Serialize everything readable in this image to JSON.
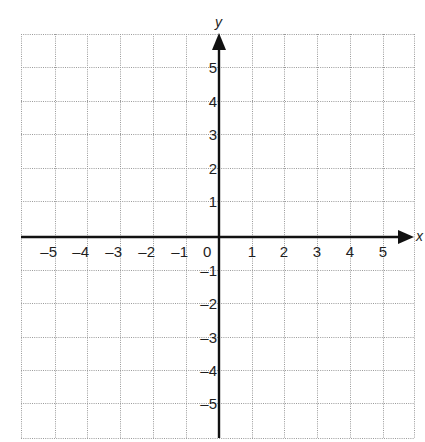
{
  "top_fragment": {
    "text": "(y = ...)"
  },
  "plane": {
    "grid": {
      "left": 21,
      "top": 34,
      "right": 414,
      "bottom": 438,
      "line_color": "#9a9a9a",
      "axis_color": "#111111"
    },
    "x_axis": {
      "name": "x",
      "y_px": 237,
      "min": -5,
      "max": 5,
      "arrow": "right"
    },
    "y_axis": {
      "name": "y",
      "x_px": 219,
      "min": -5,
      "max": 5,
      "arrow": "up"
    },
    "x_gridlines": [
      21,
      55,
      87,
      120,
      153,
      186,
      219,
      252,
      284,
      317,
      350,
      383,
      414
    ],
    "y_gridlines": [
      34,
      67,
      101,
      134,
      168,
      201,
      237,
      270,
      303,
      337,
      370,
      403,
      438
    ],
    "x_tick_labels": [
      {
        "value": "–5",
        "x": 55
      },
      {
        "value": "–4",
        "x": 87
      },
      {
        "value": "–3",
        "x": 120
      },
      {
        "value": "–2",
        "x": 153
      },
      {
        "value": "–1",
        "x": 186
      },
      {
        "value": "0",
        "x": 215
      },
      {
        "value": "1",
        "x": 252
      },
      {
        "value": "2",
        "x": 284
      },
      {
        "value": "3",
        "x": 317
      },
      {
        "value": "4",
        "x": 350
      },
      {
        "value": "5",
        "x": 383
      }
    ],
    "y_tick_labels": [
      {
        "value": "5",
        "y": 67
      },
      {
        "value": "4",
        "y": 101
      },
      {
        "value": "3",
        "y": 134
      },
      {
        "value": "2",
        "y": 168
      },
      {
        "value": "1",
        "y": 201
      },
      {
        "value": "–1",
        "y": 270
      },
      {
        "value": "–2",
        "y": 303
      },
      {
        "value": "–3",
        "y": 337
      },
      {
        "value": "–4",
        "y": 370
      },
      {
        "value": "–5",
        "y": 403
      }
    ]
  }
}
